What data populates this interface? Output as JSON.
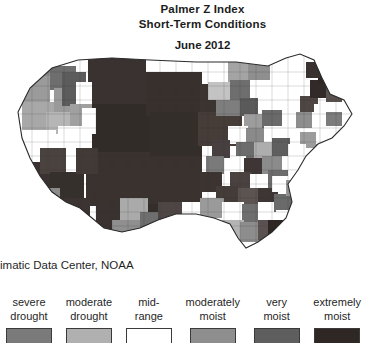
{
  "title": {
    "line1": "Palmer Z Index",
    "line2": "Short-Term Conditions",
    "date": "June 2012"
  },
  "attribution": "imatic Data Center, NOAA",
  "legend": {
    "items": [
      {
        "line1": "severe",
        "line2": "drought",
        "color": "#7a7a7a"
      },
      {
        "line1": "moderate",
        "line2": "drought",
        "color": "#b0b0b0"
      },
      {
        "line1": "mid-",
        "line2": "range",
        "color": "#ffffff"
      },
      {
        "line1": "moderately",
        "line2": "moist",
        "color": "#8e8e8e"
      },
      {
        "line1": "very",
        "line2": "moist",
        "color": "#5e5e5e"
      },
      {
        "line1": "extremely",
        "line2": "moist",
        "color": "#2e2724"
      }
    ]
  },
  "map": {
    "type": "choropleth",
    "region": "Contiguous United States (county level)",
    "outline_color": "#333333",
    "background": "#ffffff",
    "note": "Map is cropped at the left edge of the image."
  }
}
